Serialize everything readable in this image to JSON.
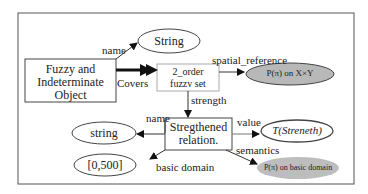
{
  "diagram": {
    "nodes": {
      "fuzzy_object": {
        "line1": "Fuzzy and",
        "line2": "Indeterminate",
        "line3": "Object"
      },
      "string_top": {
        "label": "String"
      },
      "fuzzy_set": {
        "line1": "2_order",
        "line2": "fuzzv set"
      },
      "pxy": {
        "label": "P(π) on X×Y"
      },
      "strengthened": {
        "line1": "Stregthened",
        "line2": "relation."
      },
      "string_low": {
        "label": "string"
      },
      "domain": {
        "label": "[0,500]"
      },
      "tstrength": {
        "label": "T(Streneth)"
      },
      "p_basic": {
        "label": "P(π) on basic domain"
      }
    },
    "edges": {
      "name_top": "name",
      "covers": "Covers",
      "spatial_reference": "spatial_reference",
      "strength": "strength",
      "name_low": "name",
      "value": "value",
      "semantics": "semantics",
      "basic_domain": "basic domain"
    },
    "colors": {
      "line": "#333333",
      "gray_fill": "#b8b8b8",
      "frame": "#444444"
    }
  }
}
